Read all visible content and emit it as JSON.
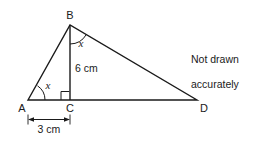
{
  "figure": {
    "note": {
      "line1": "Not drawn",
      "line2": "accurately"
    },
    "stroke_color": "#1a1a1a",
    "background_color": "#ffffff",
    "vertices": {
      "A": {
        "label": "A",
        "x": 28,
        "y": 100
      },
      "B": {
        "label": "B",
        "x": 70,
        "y": 25
      },
      "C": {
        "label": "C",
        "x": 70,
        "y": 100
      },
      "D": {
        "label": "D",
        "x": 197,
        "y": 100
      }
    },
    "angles": [
      {
        "id": "angle-at-A",
        "label": "x",
        "vertex": "A"
      },
      {
        "id": "angle-at-B",
        "label": "x",
        "vertex": "B"
      },
      {
        "id": "right-angle-at-C",
        "label": "",
        "vertex": "C"
      }
    ],
    "measurements": [
      {
        "id": "altitude-BC",
        "label": "6 cm",
        "value": 6,
        "unit": "cm",
        "segment": "BC"
      },
      {
        "id": "base-AC",
        "label": "3 cm",
        "value": 3,
        "unit": "cm",
        "segment": "AC"
      }
    ]
  }
}
